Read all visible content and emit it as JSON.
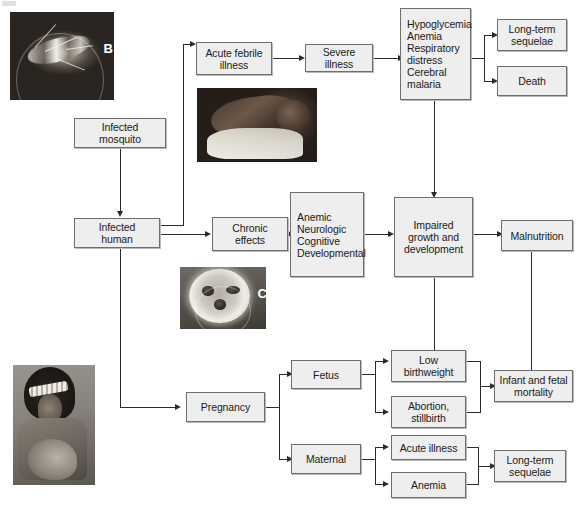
{
  "figure": {
    "type": "flowchart",
    "artifact_label": ""
  },
  "nodes": {
    "infected_mosquito": "Infected\nmosquito",
    "infected_human": "Infected\nhuman",
    "acute_febrile_illness": "Acute febrile\nillness",
    "severe_illness": "Severe illness",
    "severe_symptoms": "Hypoglycemia\nAnemia\nRespiratory\n  distress\nCerebral\n  malaria",
    "long_term_sequelae_top": "Long-term\nsequelae",
    "death": "Death",
    "chronic_effects": "Chronic\neffects",
    "chronic_symptoms": "Anemic\nNeurologic\nCognitive\nDevelopmental",
    "impaired_growth": "Impaired\ngrowth and\ndevelopment",
    "malnutrition": "Malnutrition",
    "pregnancy": "Pregnancy",
    "fetus": "Fetus",
    "maternal": "Maternal",
    "low_birthweight": "Low\nbirthweight",
    "abortion_stillbirth": "Abortion,\nstillbirth",
    "infant_fetal_mortality": "Infant and fetal\nmortality",
    "acute_illness": "Acute illness",
    "anemia": "Anemia",
    "long_term_sequelae_bottom": "Long-term\nsequelae"
  },
  "photos": {
    "mosquito": {
      "caption": "B",
      "alt": "infected mosquito feeding"
    },
    "infant": {
      "caption": "",
      "alt": "infant with severe illness"
    },
    "smear": {
      "caption": "C",
      "alt": "blood smear microscopy"
    },
    "mother": {
      "caption": "",
      "alt": "mother breastfeeding infant"
    }
  },
  "style": {
    "box_fill": "#eeeeee",
    "box_border": "#6e6e6e",
    "line_color": "#2b2b2b",
    "text_color": "#1a1a1a",
    "background": "#ffffff"
  }
}
